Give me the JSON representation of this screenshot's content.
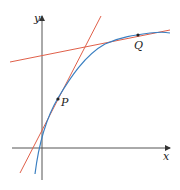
{
  "diagram": {
    "axes": {
      "x_label": "x",
      "y_label": "y"
    },
    "points": [
      {
        "label": "P",
        "description": "point on curve where steep tangent touches"
      },
      {
        "label": "Q",
        "description": "point on curve where shallow tangent touches"
      }
    ],
    "curve": {
      "description": "increasing concave-down curve",
      "color": "#3a7fc1"
    },
    "tangent_lines": [
      {
        "at": "P",
        "color": "#e0604a"
      },
      {
        "at": "Q",
        "color": "#e0604a"
      }
    ],
    "colors": {
      "axis": "#333333",
      "curve": "#3a7fc1",
      "tangent": "#e0604a",
      "point": "#222222"
    }
  }
}
